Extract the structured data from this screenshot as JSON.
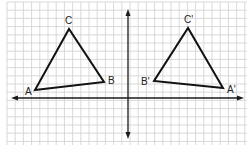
{
  "figure": {
    "colors": {
      "background": "#ffffff",
      "grid": "#cfcfcf",
      "axis": "#1a1a1a",
      "triangle": "#111111",
      "label": "#222222"
    },
    "grid": {
      "x0": 7,
      "y0": 2,
      "x1": 247,
      "y1": 145,
      "step": 8.2
    },
    "axes": {
      "x_axis": {
        "y": 98,
        "x_start": 11,
        "x_end": 244,
        "arrows": [
          "left",
          "right"
        ]
      },
      "y_axis": {
        "x": 128,
        "y_start": 9,
        "y_end": 139,
        "arrows": [
          "up",
          "down"
        ]
      }
    },
    "triangles": [
      {
        "name": "original",
        "vertices": [
          {
            "label": "A",
            "x": 35,
            "y": 90,
            "lx": 25,
            "ly": 95
          },
          {
            "label": "B",
            "x": 104,
            "y": 82,
            "lx": 108,
            "ly": 84
          },
          {
            "label": "C",
            "x": 69,
            "y": 29,
            "lx": 65,
            "ly": 24
          }
        ]
      },
      {
        "name": "image",
        "vertices": [
          {
            "label": "A'",
            "x": 223,
            "y": 88,
            "lx": 227,
            "ly": 93
          },
          {
            "label": "B'",
            "x": 154,
            "y": 81,
            "lx": 141,
            "ly": 85
          },
          {
            "label": "C'",
            "x": 188,
            "y": 28,
            "lx": 184,
            "ly": 23
          }
        ]
      }
    ]
  }
}
